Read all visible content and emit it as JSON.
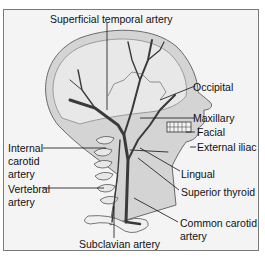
{
  "diagram": {
    "labels": {
      "superficial_temporal": "Superficial temporal artery",
      "occipital": "Occipital",
      "maxillary": "Maxillary",
      "facial": "Facial",
      "external_iliac": "External iliac",
      "internal_carotid_1": "Internal",
      "internal_carotid_2": "carotid",
      "internal_carotid_3": "artery",
      "vertebral_1": "Vertebral",
      "vertebral_2": "artery",
      "lingual": "Lingual",
      "superior_thyroid": "Superior thyroid",
      "common_carotid_1": "Common carotid",
      "common_carotid_2": "artery",
      "subclavian": "Subclavian artery"
    },
    "colors": {
      "background": "#f4f4f4",
      "skin": "#d8d8d8",
      "skull": "#e6e6e6",
      "artery": "#3a3a3a",
      "line": "#111111"
    }
  }
}
